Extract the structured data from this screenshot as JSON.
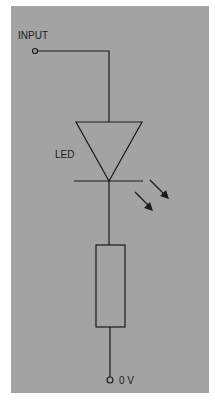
{
  "diagram": {
    "type": "circuit-schematic",
    "background_color": "#a3a3a3",
    "line_color": "#1a1a1a",
    "labels": {
      "input": "INPUT",
      "led": "LED",
      "ground": "0 V"
    },
    "components": [
      {
        "name": "input-terminal",
        "kind": "terminal"
      },
      {
        "name": "led",
        "kind": "light-emitting-diode",
        "label": "LED"
      },
      {
        "name": "resistor",
        "kind": "resistor"
      },
      {
        "name": "ground-terminal",
        "kind": "terminal",
        "label": "0 V"
      }
    ]
  }
}
